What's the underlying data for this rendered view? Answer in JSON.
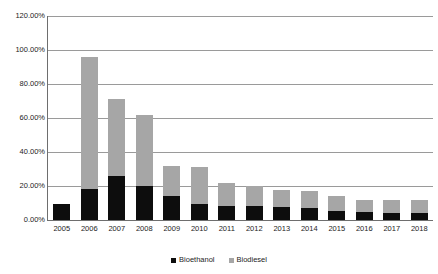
{
  "chart_data": {
    "type": "bar",
    "stacked": true,
    "title": "",
    "xlabel": "",
    "ylabel": "",
    "ylim": [
      0,
      120
    ],
    "ytick_labels": [
      "120.00%",
      "100.00%",
      "80.00%",
      "60.00%",
      "40.00%",
      "20.00%",
      "0.00%"
    ],
    "ytick_values": [
      120,
      100,
      80,
      60,
      40,
      20,
      0
    ],
    "grid": true,
    "legend_position": "bottom",
    "categories": [
      "2005",
      "2006",
      "2007",
      "2008",
      "2009",
      "2010",
      "2011",
      "2012",
      "2013",
      "2014",
      "2015",
      "2016",
      "2017",
      "2018"
    ],
    "series": [
      {
        "name": "Bioethanol",
        "color": "#0d0d0d",
        "values": [
          9.5,
          18.0,
          26.0,
          20.0,
          14.0,
          9.5,
          8.0,
          8.0,
          7.5,
          7.0,
          5.5,
          4.5,
          4.0,
          4.0
        ]
      },
      {
        "name": "Biodiesel",
        "color": "#a6a6a6",
        "values": [
          0.0,
          78.0,
          45.0,
          41.5,
          18.0,
          21.5,
          13.5,
          12.0,
          10.0,
          10.0,
          8.5,
          7.0,
          7.5,
          7.5
        ]
      }
    ],
    "totals": [
      9.5,
      96.0,
      71.0,
      61.5,
      32.0,
      31.0,
      21.5,
      20.0,
      17.5,
      17.0,
      14.0,
      11.5,
      11.5,
      11.5
    ]
  },
  "legend": {
    "entries": [
      {
        "label": "Bioethanol"
      },
      {
        "label": "Biodiesel"
      }
    ]
  }
}
